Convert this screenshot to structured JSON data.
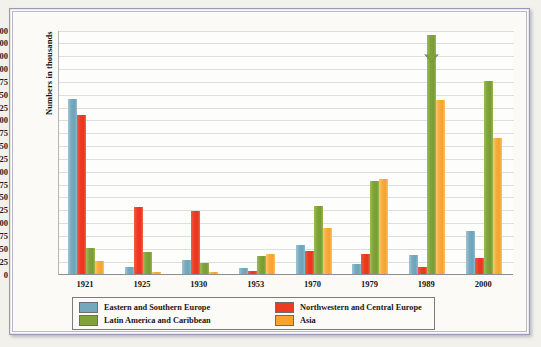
{
  "chart_data": {
    "type": "bar",
    "title": "",
    "subtitle": "",
    "xlabel": "",
    "ylabel": "Numbers in thousands",
    "categories": [
      "1921",
      "1925",
      "1930",
      "1953",
      "1970",
      "1979",
      "1989",
      "2000"
    ],
    "series": [
      {
        "name": "Eastern and Southern Europe",
        "color": "#74a9bd",
        "values": [
          340,
          14,
          28,
          12,
          57,
          19,
          37,
          83
        ]
      },
      {
        "name": "Northwestern and Central Europe",
        "color": "#ed3b22",
        "values": [
          310,
          130,
          122,
          5,
          44,
          38,
          14,
          31
        ]
      },
      {
        "name": "Latin America and Caribbean",
        "color": "#7fa23a",
        "values": [
          50,
          43,
          21,
          35,
          133,
          181,
          665,
          375
        ]
      },
      {
        "name": "Asia",
        "color": "#f6a42f",
        "values": [
          25,
          3,
          3,
          38,
          90,
          184,
          338,
          265
        ]
      }
    ],
    "ytick_labels": [
      "0",
      "25",
      "50",
      "75",
      "100",
      "125",
      "150",
      "175",
      "200",
      "225",
      "250",
      "275",
      "300",
      "325",
      "350",
      "375",
      "400",
      "500",
      "600",
      "700"
    ],
    "ytick_values": [
      0,
      25,
      50,
      75,
      100,
      125,
      150,
      175,
      200,
      225,
      250,
      275,
      300,
      325,
      350,
      375,
      400,
      500,
      600,
      700
    ],
    "ylim": [
      0,
      700
    ],
    "axis_note": "broken / non-linear y-axis: evenly spaced ticks, 25-unit steps to 400 then 100-unit steps to 700",
    "grid": true,
    "legend_position": "bottom",
    "annotations": [
      {
        "series": "Latin America and Caribbean",
        "category": "1989",
        "note": "axis-break arrow drawn on bar"
      }
    ]
  },
  "legend": {
    "items": [
      {
        "label": "Eastern and Southern Europe",
        "color": "#74a9bd"
      },
      {
        "label": "Northwestern and Central Europe",
        "color": "#ed3b22"
      },
      {
        "label": "Latin America and Caribbean",
        "color": "#7fa23a"
      },
      {
        "label": "Asia",
        "color": "#f6a42f"
      }
    ]
  },
  "caption": ""
}
